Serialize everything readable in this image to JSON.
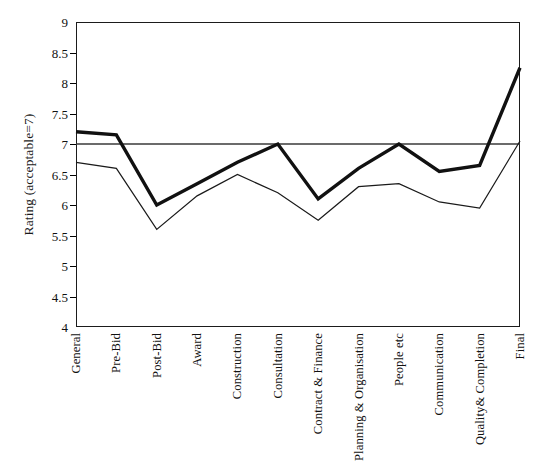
{
  "chart_data": {
    "type": "line",
    "title": "",
    "xlabel": "",
    "ylabel": "Rating (acceptable=7)",
    "ylim": [
      4,
      9
    ],
    "yticks": [
      "9",
      "8.5",
      "8",
      "7.5",
      "7",
      "6.5",
      "6",
      "5.5",
      "5",
      "4.5",
      "4"
    ],
    "ytick_values": [
      9,
      8.5,
      8,
      7.5,
      7,
      6.5,
      6,
      5.5,
      5,
      4.5,
      4
    ],
    "grid": false,
    "legend": "none",
    "categories": [
      "General",
      "Pre-Bid",
      "Post-Bid",
      "Award",
      "Construction",
      "Consultation",
      "Contract & Finance",
      "Planning & Organisation",
      "People etc",
      "Communication",
      "Quality& Completion",
      "Final"
    ],
    "series": [
      {
        "name": "thick-series",
        "style": "thick-solid",
        "color": "#111111",
        "linewidth": 3.4,
        "values": [
          7.2,
          7.15,
          6.0,
          6.35,
          6.7,
          7.0,
          6.1,
          6.6,
          7.0,
          6.55,
          6.65,
          8.25
        ]
      },
      {
        "name": "thin-series",
        "style": "thin-solid",
        "color": "#1a1a1a",
        "linewidth": 1.2,
        "values": [
          6.7,
          6.6,
          5.6,
          6.15,
          6.5,
          6.2,
          5.75,
          6.3,
          6.35,
          6.05,
          5.95,
          7.05
        ]
      }
    ],
    "reference_line": {
      "name": "acceptable-threshold",
      "value": 7,
      "color": "#3a3a3a",
      "linewidth": 1.6
    }
  }
}
